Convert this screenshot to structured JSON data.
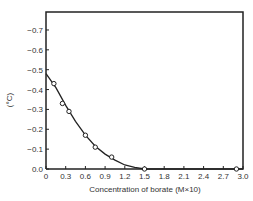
{
  "chart_data": {
    "type": "line",
    "title": "",
    "xlabel": "Concentration of borate (M×10)",
    "ylabel": "(°C)",
    "xlim": [
      0,
      3.0
    ],
    "ylim": [
      0.0,
      -0.8
    ],
    "x_ticks": [
      "0",
      "0.3",
      "0.6",
      "0.9",
      "1.2",
      "1.5",
      "1.8",
      "2.1",
      "2.4",
      "2.7",
      "3.0"
    ],
    "y_ticks": [
      "0.0",
      "-0.1",
      "-0.2",
      "-0.3",
      "-0.4",
      "-0.5",
      "-0.6",
      "-0.7"
    ],
    "grid": false,
    "legend": null,
    "series": [
      {
        "name": "measured",
        "marker": "open-circle",
        "x": [
          0.12,
          0.25,
          0.35,
          0.6,
          0.75,
          1.0,
          1.5,
          2.9
        ],
        "y": [
          -0.43,
          -0.33,
          -0.29,
          -0.17,
          -0.11,
          -0.06,
          0.0,
          0.0
        ]
      },
      {
        "name": "fitted curve",
        "marker": "none",
        "x": [
          0.0,
          0.15,
          0.3,
          0.45,
          0.6,
          0.75,
          0.9,
          1.05,
          1.2,
          1.35,
          1.5,
          1.8,
          3.0
        ],
        "y": [
          -0.48,
          -0.41,
          -0.32,
          -0.24,
          -0.17,
          -0.115,
          -0.075,
          -0.045,
          -0.02,
          -0.008,
          0.0,
          0.0,
          0.0
        ]
      }
    ]
  }
}
